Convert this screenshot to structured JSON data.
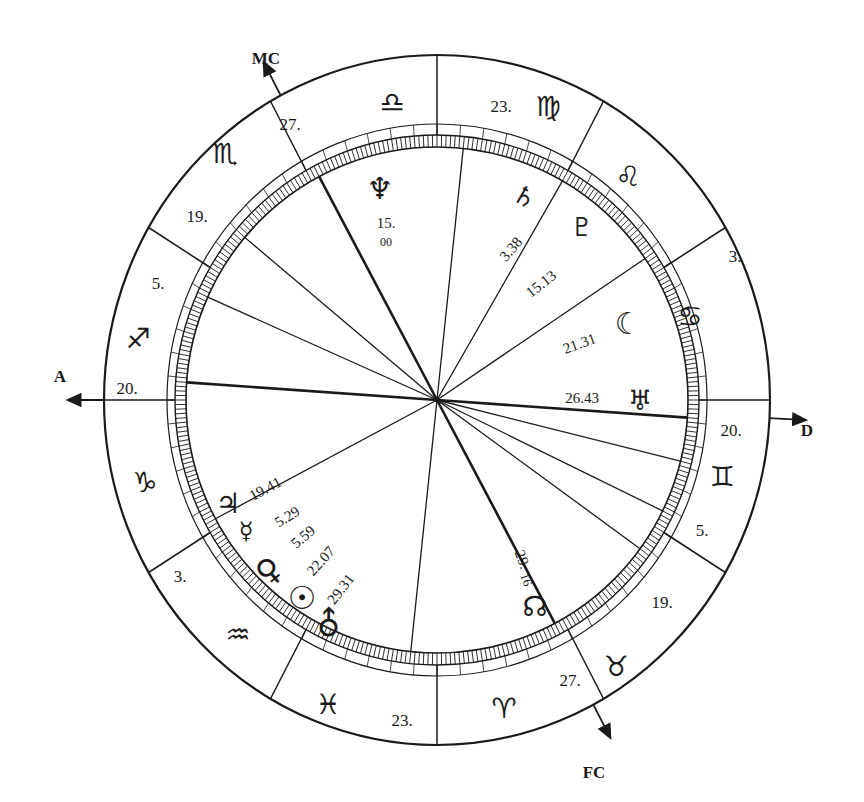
{
  "chart": {
    "center": {
      "x": 437,
      "y": 400
    },
    "outer_radius": {
      "rx": 333,
      "ry": 345
    },
    "band_inner_radius": {
      "rx": 270,
      "ry": 276
    },
    "tick_ring_outer": {
      "rx": 262,
      "ry": 265
    },
    "tick_ring_inner": {
      "rx": 251,
      "ry": 253
    },
    "ink_color": "#1a1a1a",
    "background": "#ffffff"
  },
  "axes": [
    {
      "id": "mc",
      "label": "MC",
      "angle": 118,
      "label_x": 266,
      "label_y": 64
    },
    {
      "id": "a",
      "label": "A",
      "angle": 180,
      "label_x": 60,
      "label_y": 382
    },
    {
      "id": "d",
      "label": "D",
      "angle": -3,
      "label_x": 807,
      "label_y": 436
    },
    {
      "id": "fc",
      "label": "FC",
      "angle": -62,
      "label_x": 594,
      "label_y": 778
    }
  ],
  "signs": [
    {
      "name": "Libra",
      "glyph": "♎",
      "x": 392,
      "y": 104
    },
    {
      "name": "Virgo",
      "glyph": "♍",
      "x": 548,
      "y": 108
    },
    {
      "name": "Leo",
      "glyph": "♌",
      "x": 628,
      "y": 178
    },
    {
      "name": "Cancer",
      "glyph": "♋",
      "x": 690,
      "y": 318
    },
    {
      "name": "Gemini",
      "glyph": "♊",
      "x": 722,
      "y": 478
    },
    {
      "name": "Taurus",
      "glyph": "♉",
      "x": 616,
      "y": 668
    },
    {
      "name": "Aries",
      "glyph": "♈",
      "x": 504,
      "y": 710
    },
    {
      "name": "Pisces",
      "glyph": "♓",
      "x": 328,
      "y": 706
    },
    {
      "name": "Aquarius",
      "glyph": "♒",
      "x": 238,
      "y": 636
    },
    {
      "name": "Capricorn",
      "glyph": "♑",
      "x": 145,
      "y": 484
    },
    {
      "name": "Sagittarius",
      "glyph": "♐",
      "x": 138,
      "y": 340
    },
    {
      "name": "Scorpio",
      "glyph": "♏",
      "x": 225,
      "y": 155
    }
  ],
  "cusp_degrees": [
    {
      "label": "27.",
      "x": 290,
      "y": 126
    },
    {
      "label": "23.",
      "x": 501,
      "y": 108
    },
    {
      "label": "3.",
      "x": 735,
      "y": 258
    },
    {
      "label": "20.",
      "x": 731,
      "y": 432
    },
    {
      "label": "5.",
      "x": 702,
      "y": 532
    },
    {
      "label": "19.",
      "x": 662,
      "y": 604
    },
    {
      "label": "27.",
      "x": 570,
      "y": 682
    },
    {
      "label": "23.",
      "x": 402,
      "y": 722
    },
    {
      "label": "3.",
      "x": 180,
      "y": 578
    },
    {
      "label": "20.",
      "x": 127,
      "y": 390
    },
    {
      "label": "5.",
      "x": 158,
      "y": 285
    },
    {
      "label": "19.",
      "x": 197,
      "y": 218
    }
  ],
  "house_lines": [
    {
      "angle": 118,
      "heavy": true
    },
    {
      "angle": 84,
      "heavy": false
    },
    {
      "angle": 60,
      "heavy": false
    },
    {
      "angle": 34,
      "heavy": false
    },
    {
      "angle": -4,
      "heavy": true
    },
    {
      "angle": -14,
      "heavy": false
    },
    {
      "angle": -26,
      "heavy": false
    },
    {
      "angle": -36,
      "heavy": false
    },
    {
      "angle": -62,
      "heavy": true
    },
    {
      "angle": -96,
      "heavy": false
    },
    {
      "angle": 208,
      "heavy": false
    },
    {
      "angle": 176,
      "heavy": true
    },
    {
      "angle": 156,
      "heavy": false
    },
    {
      "angle": 140,
      "heavy": false
    }
  ],
  "planets": [
    {
      "name": "Neptune",
      "glyph": "♆",
      "x": 380,
      "y": 190,
      "size": 30,
      "rot": 0,
      "degree": "15.",
      "degree2": "00",
      "deg_x": 386,
      "deg_y": 225,
      "deg_rot": 0
    },
    {
      "name": "Saturn",
      "glyph": "♄",
      "x": 524,
      "y": 198,
      "size": 26,
      "rot": 30,
      "degree": "3.38",
      "deg_x": 512,
      "deg_y": 250,
      "deg_rot": -50
    },
    {
      "name": "Pluto",
      "glyph": "♇",
      "x": 582,
      "y": 228,
      "size": 26,
      "rot": 0,
      "degree": "15.13",
      "deg_x": 542,
      "deg_y": 285,
      "deg_rot": -38
    },
    {
      "name": "Moon",
      "glyph": "☽",
      "x": 628,
      "y": 320,
      "size": 30,
      "rot": 180,
      "degree": "21.31",
      "deg_x": 580,
      "deg_y": 345,
      "deg_rot": -20
    },
    {
      "name": "Uranus",
      "glyph": "♅",
      "x": 640,
      "y": 402,
      "size": 28,
      "rot": 0,
      "degree": "26.43",
      "deg_x": 582,
      "deg_y": 400,
      "deg_rot": 0
    },
    {
      "name": "Jupiter",
      "glyph": "♃",
      "x": 228,
      "y": 505,
      "size": 28,
      "rot": 0,
      "degree": "19.41",
      "deg_x": 266,
      "deg_y": 490,
      "deg_rot": -28
    },
    {
      "name": "Mercury",
      "glyph": "☿",
      "x": 246,
      "y": 532,
      "size": 24,
      "rot": 0,
      "degree": "5.29",
      "deg_x": 288,
      "deg_y": 518,
      "deg_rot": -32
    },
    {
      "name": "Venus",
      "glyph": "♀",
      "x": 270,
      "y": 572,
      "size": 32,
      "rot": -40,
      "degree": "5.59",
      "deg_x": 304,
      "deg_y": 538,
      "deg_rot": -40
    },
    {
      "name": "Sun",
      "glyph": "☉",
      "x": 302,
      "y": 600,
      "size": 32,
      "rot": 0,
      "degree": "22.07",
      "deg_x": 322,
      "deg_y": 562,
      "deg_rot": -48
    },
    {
      "name": "Mars",
      "glyph": "♂",
      "x": 330,
      "y": 625,
      "size": 32,
      "rot": -45,
      "degree": "29.31",
      "deg_x": 342,
      "deg_y": 590,
      "deg_rot": -52
    }
  ],
  "node": {
    "name": "North Node",
    "glyph": "☊",
    "x": 535,
    "y": 608,
    "size": 28,
    "degree": "29.",
    "degree2": "16",
    "deg_x": 521,
    "deg_y": 560,
    "deg_rot": 70
  }
}
